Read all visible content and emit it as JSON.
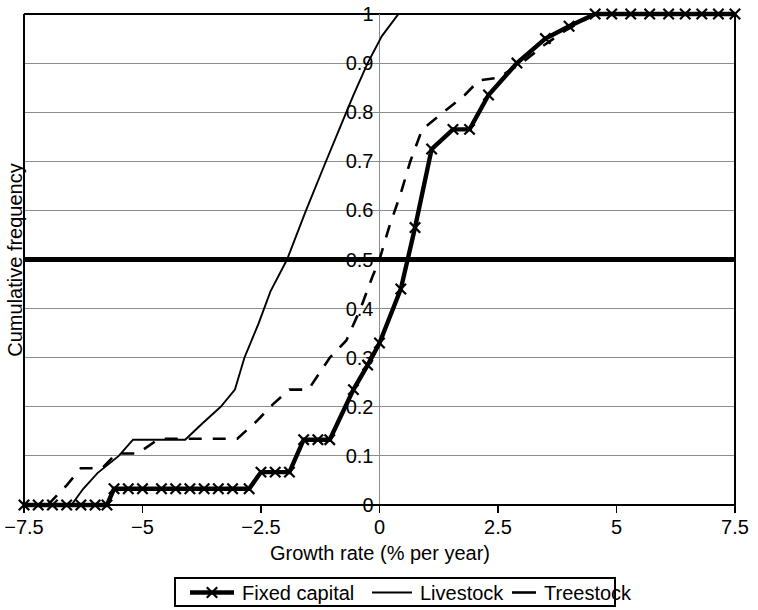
{
  "chart_data": {
    "type": "line",
    "title": "",
    "xlabel": "Growth rate (% per year)",
    "ylabel": "Cumulative frequency",
    "xlim": [
      -7.5,
      7.5
    ],
    "ylim": [
      0,
      1
    ],
    "xticks": [
      -7.5,
      -5,
      -2.5,
      0,
      2.5,
      5,
      7.5
    ],
    "xticklabels": [
      "−7.5",
      "−5",
      "−2.5",
      "0",
      "2.5",
      "5",
      "7.5"
    ],
    "yticks": [
      0,
      0.1,
      0.2,
      0.3,
      0.4,
      0.5,
      0.6,
      0.7,
      0.8,
      0.9,
      1
    ],
    "yticklabels": [
      "0",
      "0.1",
      "0.2",
      "0.3",
      "0.4",
      "0.5",
      "0.6",
      "0.7",
      "0.8",
      "0.9",
      "1"
    ],
    "grid": true,
    "grid_axis": "y",
    "ytick_label_position": "at-x-zero",
    "reference_line": {
      "y": 0.5,
      "style": "bold-solid"
    },
    "legend_position": "below",
    "series": [
      {
        "name": "Fixed capital",
        "style": "solid-thick-with-x-markers",
        "marker": "x",
        "points": [
          [
            -7.5,
            0.0
          ],
          [
            -7.2,
            0.0
          ],
          [
            -6.9,
            0.0
          ],
          [
            -6.6,
            0.0
          ],
          [
            -6.3,
            0.0
          ],
          [
            -6.0,
            0.0
          ],
          [
            -5.75,
            0.0
          ],
          [
            -5.6,
            0.033
          ],
          [
            -5.3,
            0.033
          ],
          [
            -5.0,
            0.033
          ],
          [
            -4.6,
            0.033
          ],
          [
            -4.3,
            0.033
          ],
          [
            -4.0,
            0.033
          ],
          [
            -3.7,
            0.033
          ],
          [
            -3.4,
            0.033
          ],
          [
            -3.1,
            0.033
          ],
          [
            -2.75,
            0.033
          ],
          [
            -2.5,
            0.067
          ],
          [
            -2.2,
            0.067
          ],
          [
            -1.9,
            0.067
          ],
          [
            -1.6,
            0.133
          ],
          [
            -1.3,
            0.133
          ],
          [
            -1.05,
            0.133
          ],
          [
            -0.55,
            0.235
          ],
          [
            -0.25,
            0.285
          ],
          [
            0.0,
            0.33
          ],
          [
            0.45,
            0.44
          ],
          [
            0.75,
            0.565
          ],
          [
            1.1,
            0.725
          ],
          [
            1.55,
            0.765
          ],
          [
            1.9,
            0.765
          ],
          [
            2.3,
            0.835
          ],
          [
            2.9,
            0.9
          ],
          [
            3.5,
            0.95
          ],
          [
            4.0,
            0.975
          ],
          [
            4.55,
            1.0
          ],
          [
            4.9,
            1.0
          ],
          [
            5.3,
            1.0
          ],
          [
            5.7,
            1.0
          ],
          [
            6.1,
            1.0
          ],
          [
            6.45,
            1.0
          ],
          [
            6.8,
            1.0
          ],
          [
            7.15,
            1.0
          ],
          [
            7.5,
            1.0
          ]
        ]
      },
      {
        "name": "Livestock",
        "style": "solid-thin",
        "marker": "none",
        "points": [
          [
            -7.5,
            0.0
          ],
          [
            -6.5,
            0.0
          ],
          [
            -6.25,
            0.033
          ],
          [
            -5.95,
            0.065
          ],
          [
            -5.5,
            0.1
          ],
          [
            -5.2,
            0.133
          ],
          [
            -4.1,
            0.133
          ],
          [
            -3.75,
            0.165
          ],
          [
            -3.35,
            0.2
          ],
          [
            -3.05,
            0.235
          ],
          [
            -2.85,
            0.3
          ],
          [
            -2.55,
            0.37
          ],
          [
            -2.3,
            0.435
          ],
          [
            -1.95,
            0.5
          ],
          [
            -1.55,
            0.6
          ],
          [
            -1.15,
            0.695
          ],
          [
            -0.85,
            0.765
          ],
          [
            -0.55,
            0.835
          ],
          [
            -0.25,
            0.9
          ],
          [
            0.05,
            0.955
          ],
          [
            0.4,
            1.0
          ],
          [
            7.5,
            1.0
          ]
        ]
      },
      {
        "name": "Treestock",
        "style": "dashed",
        "marker": "none",
        "points": [
          [
            -7.5,
            0.0
          ],
          [
            -7.0,
            0.0
          ],
          [
            -6.6,
            0.04
          ],
          [
            -6.3,
            0.075
          ],
          [
            -5.85,
            0.075
          ],
          [
            -5.55,
            0.105
          ],
          [
            -5.1,
            0.105
          ],
          [
            -4.65,
            0.135
          ],
          [
            -4.25,
            0.135
          ],
          [
            -3.55,
            0.135
          ],
          [
            -3.0,
            0.135
          ],
          [
            -2.6,
            0.17
          ],
          [
            -2.25,
            0.205
          ],
          [
            -1.9,
            0.235
          ],
          [
            -1.5,
            0.235
          ],
          [
            -1.05,
            0.3
          ],
          [
            -0.7,
            0.335
          ],
          [
            -0.4,
            0.4
          ],
          [
            -0.15,
            0.465
          ],
          [
            0.0,
            0.5
          ],
          [
            0.2,
            0.565
          ],
          [
            0.45,
            0.635
          ],
          [
            0.65,
            0.7
          ],
          [
            0.9,
            0.765
          ],
          [
            1.35,
            0.8
          ],
          [
            1.8,
            0.835
          ],
          [
            2.1,
            0.865
          ],
          [
            2.5,
            0.87
          ],
          [
            3.0,
            0.9
          ],
          [
            3.45,
            0.935
          ],
          [
            3.9,
            0.965
          ],
          [
            4.55,
            1.0
          ],
          [
            5.1,
            1.0
          ],
          [
            5.6,
            1.0
          ]
        ]
      }
    ]
  },
  "legend": {
    "items": [
      {
        "label": "Fixed capital",
        "marker": "x-line"
      },
      {
        "label": "Livestock",
        "marker": "solid-line"
      },
      {
        "label": "Treestock",
        "marker": "dash"
      }
    ]
  },
  "colors": {
    "ink": "#000000",
    "grid": "#8d8d8d",
    "background": "#ffffff"
  }
}
